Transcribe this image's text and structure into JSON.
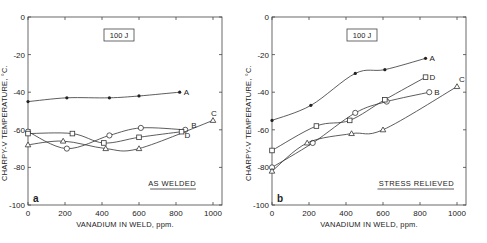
{
  "chart_data": [
    {
      "type": "line",
      "panel": "a",
      "title": "",
      "box_label": "100 J",
      "annotation": "AS WELDED",
      "xlabel": "VANADIUM IN WELD, ppm.",
      "ylabel": "CHARPY-V TEMPERATURE, °C.",
      "xlim": [
        0,
        1000
      ],
      "ylim": [
        -100,
        0
      ],
      "xticks": [
        "0",
        "200",
        "400",
        "600",
        "800",
        "1000"
      ],
      "yticks": [
        "0",
        "-20",
        "-40",
        "-60",
        "-80",
        "-100"
      ],
      "grid": false,
      "legend": "inline labels",
      "series": [
        {
          "name": "A",
          "marker": "filled-circle",
          "x": [
            0,
            210,
            440,
            600,
            820
          ],
          "y": [
            -45,
            -43,
            -43,
            -42,
            -40
          ]
        },
        {
          "name": "B",
          "marker": "open-circle",
          "x": [
            0,
            210,
            440,
            610,
            850
          ],
          "y": [
            -61,
            -70,
            -63,
            -59,
            -60
          ]
        },
        {
          "name": "C",
          "marker": "open-triangle",
          "x": [
            0,
            190,
            420,
            600,
            1000
          ],
          "y": [
            -68,
            -66,
            -70,
            -70,
            -55
          ]
        },
        {
          "name": "D",
          "marker": "open-square",
          "x": [
            0,
            240,
            410,
            600,
            830
          ],
          "y": [
            -62,
            -62,
            -67,
            -64,
            -61
          ]
        }
      ]
    },
    {
      "type": "line",
      "panel": "b",
      "title": "",
      "box_label": "100 J",
      "annotation": "STRESS RELIEVED",
      "xlabel": "VANADIUM IN WELD, ppm.",
      "ylabel": "CHARPY-V TEMPERATURE, °C.",
      "xlim": [
        0,
        1000
      ],
      "ylim": [
        -100,
        0
      ],
      "xticks": [
        "0",
        "200",
        "400",
        "600",
        "800",
        "1000"
      ],
      "yticks": [
        "0",
        "-20",
        "-40",
        "-60",
        "-80",
        "-100"
      ],
      "grid": false,
      "legend": "inline labels",
      "series": [
        {
          "name": "A",
          "marker": "filled-circle",
          "x": [
            0,
            210,
            450,
            610,
            830
          ],
          "y": [
            -55,
            -47,
            -30,
            -28,
            -22
          ]
        },
        {
          "name": "B",
          "marker": "open-circle",
          "x": [
            0,
            220,
            450,
            620,
            850
          ],
          "y": [
            -80,
            -67,
            -51,
            -45,
            -40
          ]
        },
        {
          "name": "C",
          "marker": "open-triangle",
          "x": [
            0,
            190,
            430,
            600,
            1000
          ],
          "y": [
            -82,
            -67,
            -62,
            -60,
            -37
          ]
        },
        {
          "name": "D",
          "marker": "open-square",
          "x": [
            0,
            240,
            420,
            610,
            830
          ],
          "y": [
            -71,
            -58,
            -55,
            -44,
            -32
          ]
        }
      ]
    }
  ],
  "panels": {
    "a": {
      "letter": "a",
      "box_label": "100 J",
      "annotation": "AS WELDED",
      "xlabel": "VANADIUM IN WELD, ppm.",
      "ylabel": "CHARPY-V TEMPERATURE, °C."
    },
    "b": {
      "letter": "b",
      "box_label": "100 J",
      "annotation": "STRESS RELIEVED",
      "xlabel": "VANADIUM IN WELD, ppm.",
      "ylabel": "CHARPY-V TEMPERATURE, °C."
    }
  },
  "colors": {
    "ink": "#222222",
    "background": "#ffffff"
  }
}
